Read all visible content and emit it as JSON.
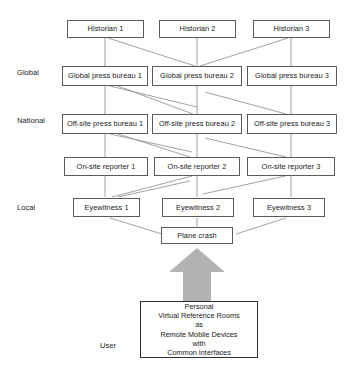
{
  "diagram": {
    "arrow_color": "#b3b3b3",
    "box_border_color": "#5a5a5a",
    "background": "#ffffff",
    "tiers": [
      {
        "label": "Global"
      },
      {
        "label": "National"
      },
      {
        "label": "Local"
      },
      {
        "label": "User"
      }
    ],
    "rows": {
      "historian": [
        {
          "label": "Historian 1"
        },
        {
          "label": "Historian 2"
        },
        {
          "label": "Historian 3"
        }
      ],
      "global_press": [
        {
          "label": "Global press bureau 1"
        },
        {
          "label": "Global press bureau 2"
        },
        {
          "label": "Global press bureau 3"
        }
      ],
      "offsite_press": [
        {
          "label": "Off-site press bureau 1"
        },
        {
          "label": "Off-site press bureau 2"
        },
        {
          "label": "Off-site press bureau 3"
        }
      ],
      "onsite_reporter": [
        {
          "label": "On-site reporter 1"
        },
        {
          "label": "On-site reporter 2"
        },
        {
          "label": "On-site reporter 3"
        }
      ],
      "eyewitness": [
        {
          "label": "Eyewitness 1"
        },
        {
          "label": "Eyewitness 2"
        },
        {
          "label": "Eyewitness 3"
        }
      ]
    },
    "event": {
      "label": "Plane crash"
    },
    "user_box": {
      "lines": [
        "Personal",
        "Virtual Reference Rooms",
        "as",
        "Remote Mobile Devices",
        "with",
        "Common Interfaces"
      ]
    }
  }
}
